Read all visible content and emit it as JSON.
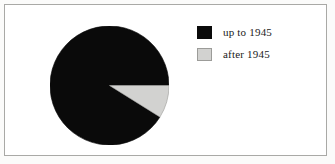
{
  "figure": {
    "frame": {
      "border_color": "#a9a9a6",
      "background": "#ffffff"
    }
  },
  "legend": {
    "position": "right",
    "items": [
      {
        "label": "up to 1945",
        "color": "#0a0a0a",
        "swatch": "black-swatch-icon"
      },
      {
        "label": "after 1945",
        "color": "#d2d2d0",
        "swatch": "gray-swatch-icon"
      }
    ]
  },
  "chart_data": {
    "type": "pie",
    "title": "",
    "subtitle": "",
    "xlabel": "",
    "ylabel": "",
    "categories": [
      "up to 1945",
      "after 1945"
    ],
    "values": [
      91,
      9
    ],
    "units": "percent",
    "colors": [
      "#0a0a0a",
      "#d2d2d0"
    ],
    "start_angle_deg": 0,
    "direction": "clockwise",
    "slices": [
      {
        "label": "up to 1945",
        "value": 91,
        "color": "#0a0a0a",
        "start_deg": 32,
        "end_deg": 360
      },
      {
        "label": "after 1945",
        "value": 9,
        "color": "#d2d2d0",
        "start_deg": 0,
        "end_deg": 32
      }
    ],
    "legend_position": "right",
    "grid": false,
    "data_labels": false
  }
}
